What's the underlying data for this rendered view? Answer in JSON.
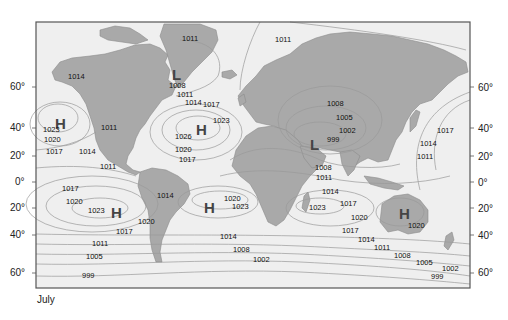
{
  "caption": "July",
  "colors": {
    "ocean": "#efefef",
    "land": "#a9a9a9",
    "land_edge": "#8c8c8c",
    "isobar": "#9a9a9a",
    "frame": "#555555",
    "text": "#111111",
    "pressure_letter": "#444444"
  },
  "latitude_labels": {
    "left": [
      {
        "text": "60°",
        "x": 10,
        "y": 82
      },
      {
        "text": "40°",
        "x": 10,
        "y": 123
      },
      {
        "text": "20°",
        "x": 10,
        "y": 151
      },
      {
        "text": "0°",
        "x": 15,
        "y": 177
      },
      {
        "text": "20°",
        "x": 10,
        "y": 203
      },
      {
        "text": "40°",
        "x": 10,
        "y": 230
      },
      {
        "text": "60°",
        "x": 10,
        "y": 268
      }
    ],
    "right": [
      {
        "text": "60°",
        "x": 478,
        "y": 83
      },
      {
        "text": "40°",
        "x": 478,
        "y": 124
      },
      {
        "text": "20°",
        "x": 478,
        "y": 152
      },
      {
        "text": "0°",
        "x": 478,
        "y": 178
      },
      {
        "text": "20°",
        "x": 478,
        "y": 204
      },
      {
        "text": "40°",
        "x": 478,
        "y": 231
      },
      {
        "text": "60°",
        "x": 478,
        "y": 268
      }
    ]
  },
  "pressure_centers": [
    {
      "type": "H",
      "x": 55,
      "y": 116
    },
    {
      "type": "L",
      "x": 172,
      "y": 67
    },
    {
      "type": "H",
      "x": 196,
      "y": 122
    },
    {
      "type": "L",
      "x": 310,
      "y": 137
    },
    {
      "type": "H",
      "x": 111,
      "y": 205
    },
    {
      "type": "H",
      "x": 204,
      "y": 200
    },
    {
      "type": "H",
      "x": 399,
      "y": 206
    }
  ],
  "isobar_labels": [
    {
      "text": "1014",
      "x": 68,
      "y": 73
    },
    {
      "text": "1011",
      "x": 182,
      "y": 35
    },
    {
      "text": "1011",
      "x": 275,
      "y": 36
    },
    {
      "text": "1008",
      "x": 169,
      "y": 82
    },
    {
      "text": "1011",
      "x": 177,
      "y": 91
    },
    {
      "text": "1014",
      "x": 185,
      "y": 99
    },
    {
      "text": "1017",
      "x": 203,
      "y": 101
    },
    {
      "text": "1023",
      "x": 43,
      "y": 126
    },
    {
      "text": "1020",
      "x": 44,
      "y": 136
    },
    {
      "text": "1017",
      "x": 46,
      "y": 148
    },
    {
      "text": "1014",
      "x": 79,
      "y": 148
    },
    {
      "text": "1011",
      "x": 101,
      "y": 124
    },
    {
      "text": "1011",
      "x": 100,
      "y": 163
    },
    {
      "text": "1023",
      "x": 213,
      "y": 117
    },
    {
      "text": "1026",
      "x": 175,
      "y": 133
    },
    {
      "text": "1020",
      "x": 175,
      "y": 146
    },
    {
      "text": "1017",
      "x": 179,
      "y": 156
    },
    {
      "text": "1008",
      "x": 327,
      "y": 100
    },
    {
      "text": "1005",
      "x": 336,
      "y": 114
    },
    {
      "text": "1002",
      "x": 339,
      "y": 127
    },
    {
      "text": "999",
      "x": 327,
      "y": 136
    },
    {
      "text": "1017",
      "x": 437,
      "y": 127
    },
    {
      "text": "1014",
      "x": 420,
      "y": 140
    },
    {
      "text": "1011",
      "x": 417,
      "y": 153
    },
    {
      "text": "1008",
      "x": 315,
      "y": 164
    },
    {
      "text": "1011",
      "x": 316,
      "y": 174
    },
    {
      "text": "1014",
      "x": 322,
      "y": 188
    },
    {
      "text": "1017",
      "x": 340,
      "y": 200
    },
    {
      "text": "1017",
      "x": 62,
      "y": 185
    },
    {
      "text": "1020",
      "x": 66,
      "y": 198
    },
    {
      "text": "1023",
      "x": 88,
      "y": 207
    },
    {
      "text": "1020",
      "x": 138,
      "y": 218
    },
    {
      "text": "1017",
      "x": 116,
      "y": 228
    },
    {
      "text": "1011",
      "x": 92,
      "y": 240
    },
    {
      "text": "1005",
      "x": 86,
      "y": 253
    },
    {
      "text": "999",
      "x": 82,
      "y": 272
    },
    {
      "text": "1014",
      "x": 157,
      "y": 192
    },
    {
      "text": "1020",
      "x": 224,
      "y": 195
    },
    {
      "text": "1023",
      "x": 232,
      "y": 203
    },
    {
      "text": "1023",
      "x": 309,
      "y": 204
    },
    {
      "text": "1020",
      "x": 351,
      "y": 214
    },
    {
      "text": "1020",
      "x": 408,
      "y": 222
    },
    {
      "text": "1017",
      "x": 342,
      "y": 227
    },
    {
      "text": "1014",
      "x": 220,
      "y": 233
    },
    {
      "text": "1014",
      "x": 358,
      "y": 236
    },
    {
      "text": "1008",
      "x": 233,
      "y": 246
    },
    {
      "text": "1011",
      "x": 374,
      "y": 244
    },
    {
      "text": "1002",
      "x": 253,
      "y": 256
    },
    {
      "text": "1008",
      "x": 394,
      "y": 252
    },
    {
      "text": "1005",
      "x": 416,
      "y": 259
    },
    {
      "text": "1002",
      "x": 442,
      "y": 265
    },
    {
      "text": "999",
      "x": 431,
      "y": 273
    }
  ]
}
